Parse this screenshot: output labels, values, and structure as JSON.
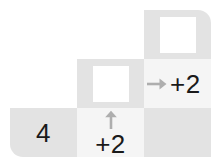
{
  "figure": {
    "kind": "arithmetic-staircase-grid",
    "colors": {
      "cell_dark": "#e3e3e3",
      "cell_light": "#f5f5f5",
      "answer_box": "#ffffff",
      "text": "#1a1a1a",
      "arrow": "#aeaeae",
      "page_background": "#ffffff"
    },
    "grid": {
      "rows": 3,
      "columns": 3,
      "cell_width": 67,
      "cell_height": 49
    }
  },
  "cells": {
    "top_left": {
      "name": "cell-top-left",
      "shade": "blank",
      "content": ""
    },
    "top_middle": {
      "name": "cell-top-middle",
      "shade": "blank",
      "content": ""
    },
    "top_right": {
      "name": "cell-top-right",
      "shade": "dark",
      "content": "",
      "has_answer_box": true
    },
    "middle_left": {
      "name": "cell-middle-left",
      "shade": "blank",
      "content": ""
    },
    "middle_middle": {
      "name": "cell-middle-middle",
      "shade": "dark",
      "content": "",
      "has_answer_box": true
    },
    "middle_right": {
      "name": "cell-middle-right",
      "shade": "light",
      "content": "+2",
      "arrow": "arrow-right"
    },
    "bottom_left": {
      "name": "cell-bottom-left",
      "shade": "dark",
      "content": "4"
    },
    "bottom_middle": {
      "name": "cell-bottom-middle",
      "shade": "light",
      "content": "+2",
      "arrow": "arrow-up"
    },
    "bottom_right": {
      "name": "cell-bottom-right",
      "shade": "dark",
      "content": ""
    }
  },
  "labels": {
    "start_value": "4",
    "operation_vertical": "+2",
    "operation_horizontal": "+2",
    "arrow_up_glyph": "arrow-up-icon",
    "arrow_right_glyph": "arrow-right-icon"
  }
}
